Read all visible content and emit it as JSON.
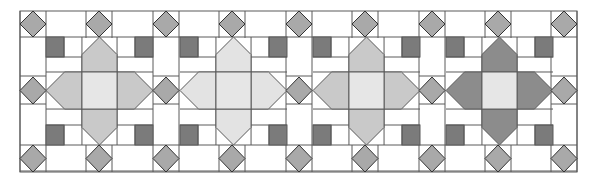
{
  "diagram": {
    "width": 595,
    "height": 184,
    "outer": {
      "x": 20,
      "y": 11,
      "w": 557,
      "h": 161
    },
    "colors": {
      "background": "#ffffff",
      "line": "#5a5a5a",
      "diamond": "#a9a9a9",
      "corner_square": "#7b7b7b",
      "center_square": "#e6e6e6"
    },
    "sashing": {
      "diamond_columns_x": [
        20,
        86,
        153,
        219,
        286,
        352,
        419,
        485,
        551
      ],
      "cell_size": 26,
      "rows_y": [
        11,
        77,
        145
      ],
      "row_height": 27
    },
    "blocks": [
      {
        "id": "block-1",
        "x": 46,
        "arm_color": "#c9c9c9"
      },
      {
        "id": "block-2",
        "x": 180,
        "arm_color": "#e3e3e3"
      },
      {
        "id": "block-3",
        "x": 313,
        "arm_color": "#c9c9c9"
      },
      {
        "id": "block-4",
        "x": 446,
        "arm_color": "#8c8c8c"
      }
    ],
    "block_geometry": {
      "y": 37,
      "w": 107,
      "h": 108,
      "col_fracs": [
        0,
        0.336,
        0.664,
        1
      ],
      "row_fracs": [
        0,
        0.324,
        0.667,
        1
      ],
      "corner_square_w": 18,
      "corner_square_h": 20
    }
  }
}
